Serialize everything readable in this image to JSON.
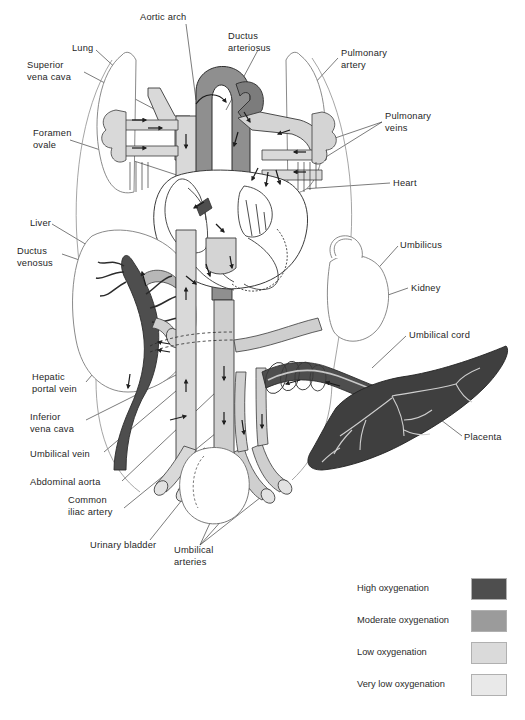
{
  "figure": {
    "type": "fetal-circulation-diagram",
    "background_color": "#ffffff",
    "line_color": "#333333"
  },
  "labels": [
    {
      "id": "aortic-arch",
      "text": "Aortic arch",
      "x": 140,
      "y": 12,
      "align": "left"
    },
    {
      "id": "ductus-arteriosus",
      "text": "Ductus\narteriosus",
      "x": 228,
      "y": 31,
      "align": "left"
    },
    {
      "id": "lung",
      "text": "Lung",
      "x": 72,
      "y": 43,
      "align": "left"
    },
    {
      "id": "pulmonary-artery",
      "text": "Pulmonary\nartery",
      "x": 341,
      "y": 48,
      "align": "left"
    },
    {
      "id": "superior-vena-cava",
      "text": "Superior\nvena cava",
      "x": 27,
      "y": 60,
      "align": "left"
    },
    {
      "id": "pulmonary-veins",
      "text": "Pulmonary\nveins",
      "x": 385,
      "y": 111,
      "align": "left"
    },
    {
      "id": "foramen-ovale",
      "text": "Foramen\novale",
      "x": 33,
      "y": 128,
      "align": "left"
    },
    {
      "id": "heart",
      "text": "Heart",
      "x": 393,
      "y": 178,
      "align": "left"
    },
    {
      "id": "liver",
      "text": "Liver",
      "x": 30,
      "y": 218,
      "align": "left"
    },
    {
      "id": "ductus-venosus",
      "text": "Ductus\nvenosus",
      "x": 17,
      "y": 246,
      "align": "left"
    },
    {
      "id": "umbilicus",
      "text": "Umbilicus",
      "x": 400,
      "y": 240,
      "align": "left"
    },
    {
      "id": "kidney",
      "text": "Kidney",
      "x": 411,
      "y": 283,
      "align": "left"
    },
    {
      "id": "umbilical-cord",
      "text": "Umbilical cord",
      "x": 409,
      "y": 330,
      "align": "left"
    },
    {
      "id": "hepatic-portal-vein",
      "text": "Hepatic\nportal vein",
      "x": 32,
      "y": 372,
      "align": "left"
    },
    {
      "id": "inferior-vena-cava",
      "text": "Inferior\nvena cava",
      "x": 30,
      "y": 412,
      "align": "left"
    },
    {
      "id": "placenta",
      "text": "Placenta",
      "x": 464,
      "y": 432,
      "align": "left"
    },
    {
      "id": "umbilical-vein",
      "text": "Umbilical vein",
      "x": 30,
      "y": 449,
      "align": "left"
    },
    {
      "id": "abdominal-aorta",
      "text": "Abdominal aorta",
      "x": 30,
      "y": 477,
      "align": "left"
    },
    {
      "id": "common-iliac-artery",
      "text": "Common\niliac artery",
      "x": 68,
      "y": 495,
      "align": "left"
    },
    {
      "id": "urinary-bladder",
      "text": "Urinary bladder",
      "x": 90,
      "y": 540,
      "align": "left"
    },
    {
      "id": "umbilical-arteries",
      "text": "Umbilical\narteries",
      "x": 174,
      "y": 545,
      "align": "left"
    }
  ],
  "legend": {
    "items": [
      {
        "label": "High oxygenation",
        "color": "#4e4e4e"
      },
      {
        "label": "Moderate oxygenation",
        "color": "#9b9b9b"
      },
      {
        "label": "Low oxygenation",
        "color": "#dadada"
      },
      {
        "label": "Very low oxygenation",
        "color": "#e9e9e9"
      }
    ]
  },
  "palette": {
    "high": "#4e4e4e",
    "moderate": "#9b9b9b",
    "low": "#dadada",
    "very_low": "#e9e9e9",
    "outline": "#3a3a3a",
    "organ_outline": "#6b6b6b",
    "leader_line": "#444444"
  }
}
